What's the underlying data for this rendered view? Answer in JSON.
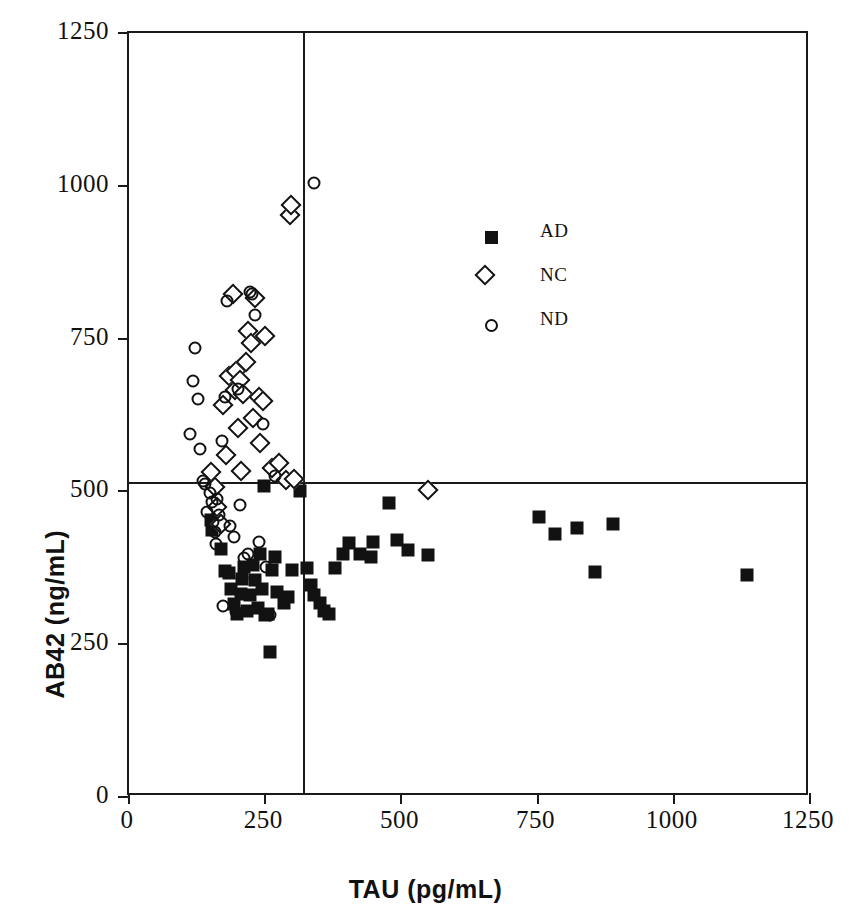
{
  "chart_data": {
    "type": "scatter",
    "title": "",
    "xlabel": "TAU  (pg/mL)",
    "ylabel": "AB42  (ng/mL)",
    "xlim": [
      0,
      1250
    ],
    "ylim": [
      0,
      1250
    ],
    "xticks": [
      "0",
      "250",
      "500",
      "750",
      "1000",
      "1250"
    ],
    "yticks": [
      "0",
      "250",
      "500",
      "750",
      "1000",
      "1250"
    ],
    "xtick_values": [
      0,
      250,
      500,
      750,
      1000,
      1250
    ],
    "ytick_values": [
      0,
      250,
      500,
      750,
      1000,
      1250
    ],
    "grid": false,
    "legend_position": "upper-center-right",
    "reference_lines": {
      "vertical_x": 320,
      "horizontal_y": 515
    },
    "legend": [
      {
        "key": "AD",
        "label": "AD",
        "marker": "filled-square"
      },
      {
        "key": "NC",
        "label": "NC",
        "marker": "open-diamond"
      },
      {
        "key": "ND",
        "label": "ND",
        "marker": "open-circle"
      }
    ],
    "series": [
      {
        "name": "AD",
        "marker": "filled-square",
        "points": [
          [
            150,
            453
          ],
          [
            152,
            437
          ],
          [
            168,
            405
          ],
          [
            176,
            370
          ],
          [
            184,
            367
          ],
          [
            188,
            341
          ],
          [
            193,
            316
          ],
          [
            199,
            300
          ],
          [
            205,
            332
          ],
          [
            208,
            356
          ],
          [
            212,
            376
          ],
          [
            216,
            304
          ],
          [
            222,
            330
          ],
          [
            228,
            380
          ],
          [
            232,
            355
          ],
          [
            236,
            310
          ],
          [
            240,
            398
          ],
          [
            244,
            341
          ],
          [
            248,
            509
          ],
          [
            250,
            297
          ],
          [
            255,
            300
          ],
          [
            258,
            238
          ],
          [
            262,
            372
          ],
          [
            268,
            392
          ],
          [
            272,
            335
          ],
          [
            285,
            318
          ],
          [
            292,
            328
          ],
          [
            300,
            371
          ],
          [
            314,
            500
          ],
          [
            326,
            375
          ],
          [
            334,
            347
          ],
          [
            340,
            330
          ],
          [
            350,
            318
          ],
          [
            358,
            305
          ],
          [
            368,
            300
          ],
          [
            378,
            374
          ],
          [
            392,
            397
          ],
          [
            404,
            415
          ],
          [
            424,
            398
          ],
          [
            444,
            392
          ],
          [
            448,
            418
          ],
          [
            478,
            481
          ],
          [
            492,
            421
          ],
          [
            512,
            404
          ],
          [
            548,
            396
          ],
          [
            752,
            458
          ],
          [
            782,
            430
          ],
          [
            822,
            440
          ],
          [
            856,
            368
          ],
          [
            888,
            447
          ],
          [
            1135,
            363
          ]
        ]
      },
      {
        "name": "NC",
        "marker": "open-diamond",
        "points": [
          [
            150,
            531
          ],
          [
            158,
            508
          ],
          [
            162,
            474
          ],
          [
            168,
            447
          ],
          [
            172,
            642
          ],
          [
            178,
            560
          ],
          [
            184,
            688
          ],
          [
            190,
            823
          ],
          [
            194,
            666
          ],
          [
            196,
            697
          ],
          [
            200,
            603
          ],
          [
            204,
            683
          ],
          [
            206,
            533
          ],
          [
            210,
            660
          ],
          [
            214,
            712
          ],
          [
            218,
            762
          ],
          [
            224,
            742
          ],
          [
            228,
            620
          ],
          [
            232,
            817
          ],
          [
            238,
            655
          ],
          [
            240,
            580
          ],
          [
            246,
            648
          ],
          [
            250,
            754
          ],
          [
            262,
            539
          ],
          [
            276,
            547
          ],
          [
            288,
            518
          ],
          [
            295,
            952
          ],
          [
            298,
            968
          ],
          [
            302,
            520
          ],
          [
            548,
            503
          ]
        ]
      },
      {
        "name": "ND",
        "marker": "open-circle",
        "points": [
          [
            112,
            594
          ],
          [
            118,
            681
          ],
          [
            122,
            734
          ],
          [
            126,
            651
          ],
          [
            130,
            570
          ],
          [
            136,
            517
          ],
          [
            140,
            512
          ],
          [
            144,
            466
          ],
          [
            148,
            498
          ],
          [
            152,
            482
          ],
          [
            154,
            450
          ],
          [
            158,
            433
          ],
          [
            160,
            414
          ],
          [
            162,
            488
          ],
          [
            166,
            461
          ],
          [
            170,
            583
          ],
          [
            172,
            312
          ],
          [
            176,
            655
          ],
          [
            180,
            812
          ],
          [
            186,
            443
          ],
          [
            192,
            425
          ],
          [
            196,
            302
          ],
          [
            200,
            668
          ],
          [
            204,
            477
          ],
          [
            208,
            358
          ],
          [
            212,
            391
          ],
          [
            218,
            398
          ],
          [
            222,
            826
          ],
          [
            226,
            823
          ],
          [
            232,
            789
          ],
          [
            238,
            417
          ],
          [
            246,
            611
          ],
          [
            252,
            376
          ],
          [
            258,
            297
          ],
          [
            268,
            525
          ],
          [
            340,
            1005
          ]
        ]
      }
    ]
  },
  "axis": {
    "x_title": "TAU  (pg/mL)",
    "y_title": "AB42  (ng/mL)"
  }
}
